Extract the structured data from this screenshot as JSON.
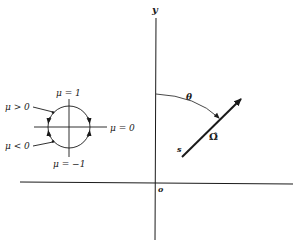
{
  "diagram": {
    "axes": {
      "y_label": "y",
      "origin_label": "o"
    },
    "direction_vector": {
      "start_label": "s",
      "unit_vector_label": "Ω̂",
      "angle_label": "θ"
    },
    "mu_circle": {
      "labels": {
        "top": "μ = 1",
        "bottom": "μ = −1",
        "right": "μ = 0",
        "upper_left": "μ > 0",
        "lower_left": "μ < 0"
      }
    },
    "colors": {
      "ink": "#1a1a1a",
      "background": "#ffffff"
    }
  }
}
